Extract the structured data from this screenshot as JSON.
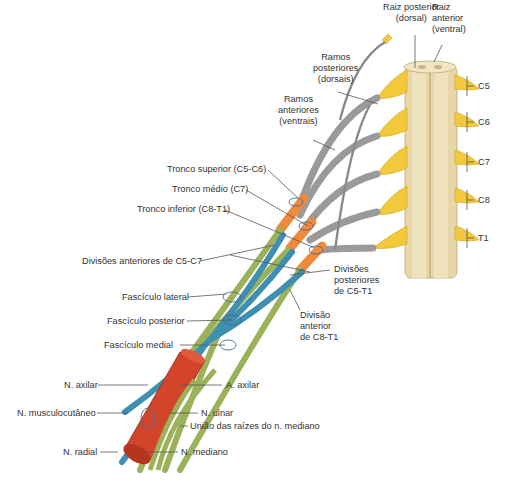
{
  "diagram": {
    "type": "anatomical-illustration",
    "colors": {
      "spinal_cord": "#e6d6a8",
      "rootlets": "#f2c93a",
      "roots_gray": "#9a9a9a",
      "trunks_orange": "#ef8a3c",
      "anterior_divisions_green": "#9bb15a",
      "posterior_divisions_blue": "#3f8fb0",
      "axillary_artery": "#d2452a",
      "leader_lines": "#555555"
    },
    "labels": {
      "raiz_posterior": [
        "Raiz posterior",
        "(dorsal)"
      ],
      "raiz_anterior": [
        "Raiz",
        "anterior",
        "(ventral)"
      ],
      "ramos_posteriores": [
        "Ramos",
        "posteriores",
        "(dorsais)"
      ],
      "ramos_anteriores": [
        "Ramos",
        "anteriores",
        "(ventrais)"
      ],
      "tronco_superior": "Tronco superior (C5-C6)",
      "tronco_medio": "Tronco médio (C7)",
      "tronco_inferior": "Tronco inferior (C8-T1)",
      "divisoes_anteriores": "Divisões anteriores de C5-C7",
      "fasciculo_lateral": "Fascículo lateral",
      "fasciculo_posterior": "Fascículo posterior",
      "fasciculo_medial": "Fascículo medial",
      "divisoes_posteriores": [
        "Divisões",
        "posteriores",
        "de C5-T1"
      ],
      "divisao_anterior": [
        "Divisão",
        "anterior",
        "de C8-T1"
      ],
      "n_axilar": "N. axilar",
      "a_axilar": "A. axilar",
      "n_musculocutaneo": "N. musculocutâneo",
      "n_ulnar": "N. ulnar",
      "uniao_raizes": "União das raízes do n. mediano",
      "n_radial": "N. radial",
      "n_mediano": "N. mediano"
    },
    "segments": [
      "C5",
      "C6",
      "C7",
      "C8",
      "T1"
    ]
  }
}
